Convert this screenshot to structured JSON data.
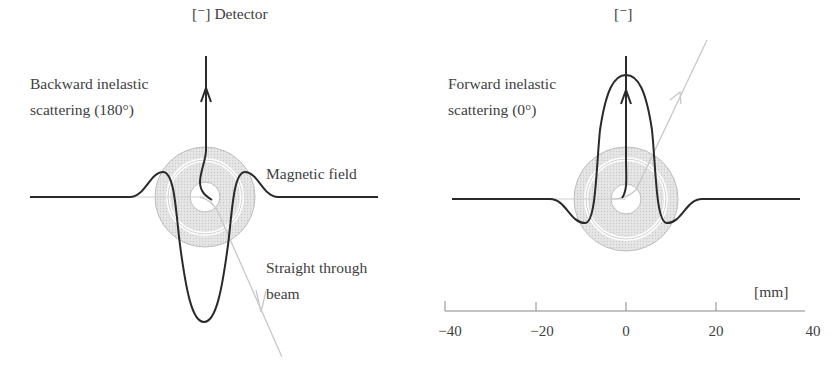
{
  "figure": {
    "left_panel": {
      "detector_label": "[⁻] Detector",
      "scattering_label_line1": "Backward inelastic",
      "scattering_label_line2": "scattering (180°)",
      "magnetic_field_label": "Magnetic field",
      "beam_label_line1": "Straight through",
      "beam_label_line2": "beam"
    },
    "right_panel": {
      "detector_label": "[⁻]",
      "scattering_label_line1": "Forward inelastic",
      "scattering_label_line2": "scattering (0°)"
    },
    "axis": {
      "unit_label": "[mm]",
      "ticks": [
        "−40",
        "−20",
        "0",
        "20",
        "40"
      ],
      "tick_values": [
        -40,
        -20,
        0,
        20,
        40
      ]
    },
    "colors": {
      "trajectory": "#2a2a2a",
      "beam": "#c8c8c8",
      "field_fill": "#e2e2e2",
      "field_ring": "#bdbdbd"
    }
  }
}
